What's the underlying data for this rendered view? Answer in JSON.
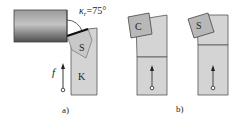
{
  "figure_a": {
    "angle_label_symbol": "κ",
    "angle_label_sub": "r",
    "angle_label_value": "=75°",
    "insert_label": "S",
    "holder_label": "K",
    "feed_label": "f",
    "caption": "a)"
  },
  "figure_b": {
    "left_insert_label": "C",
    "right_insert_label": "S",
    "caption": "b)"
  },
  "colors": {
    "tool_fill": "#d4d4d4",
    "insert_fill": "#bdbdbd",
    "outline": "#555555",
    "workpiece_dark": "#5a5a5a",
    "workpiece_light": "#c8c8c8",
    "cutting_edge": "#111111"
  }
}
